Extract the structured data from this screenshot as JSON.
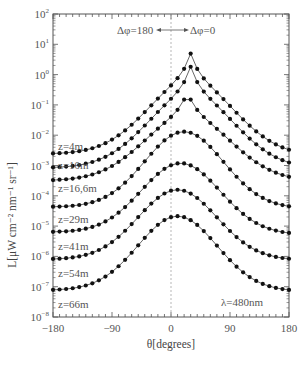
{
  "chart_data": {
    "type": "line",
    "title": "",
    "xlabel": "θ[degrees]",
    "ylabel": "L[μW cm⁻² nm⁻¹ sr⁻¹]",
    "xlim": [
      -180,
      180
    ],
    "ylim": [
      1e-08,
      100
    ],
    "yscale": "log",
    "grid": false,
    "x_ticks": [
      -180,
      -90,
      0,
      90,
      180
    ],
    "y_ticks": [
      "10²",
      "10¹",
      "10⁰",
      "10⁻¹",
      "10⁻²",
      "10⁻³",
      "10⁻⁴",
      "10⁻⁵",
      "10⁻⁶",
      "10⁻⁷",
      "10⁻⁸"
    ],
    "y_tick_exponents": [
      2,
      1,
      0,
      -1,
      -2,
      -3,
      -4,
      -5,
      -6,
      -7,
      -8
    ],
    "vertical_reference_line": 0,
    "annotations": {
      "direction_left": "Δφ=180",
      "direction_right": "Δφ=0",
      "wavelength": "λ=480nm"
    },
    "series_model_note": "Values are log10(L) read from the plot; x from -180 to 180 every 10 degrees",
    "series": [
      {
        "name": "z=4m",
        "left": -2.62,
        "right": -2.68,
        "peak": 0.7,
        "peak_x": 30,
        "sharp": true
      },
      {
        "name": "z=10m",
        "left": -3.08,
        "right": -3.1,
        "peak": 0.26,
        "peak_x": 30,
        "sharp": true
      },
      {
        "name": "z=16,6m",
        "left": -3.5,
        "right": -3.52,
        "peak": -0.57,
        "peak_x": 25,
        "sharp": true
      },
      {
        "name": "z=29m",
        "left": -4.37,
        "right": -4.42,
        "peak": -1.88,
        "peak_x": 20,
        "sharp": false
      },
      {
        "name": "z=41m",
        "left": -5.2,
        "right": -5.28,
        "peak": -2.92,
        "peak_x": 15,
        "sharp": false
      },
      {
        "name": "z=54m",
        "left": -6.1,
        "right": -6.12,
        "peak": -3.8,
        "peak_x": 10,
        "sharp": false
      },
      {
        "name": "z=66m",
        "left": -7.12,
        "right": -7.15,
        "peak": -4.67,
        "peak_x": 10,
        "sharp": false
      }
    ],
    "label_positions": [
      {
        "name": "z=4m",
        "y_exp": -2.35
      },
      {
        "name": "z=10m",
        "y_exp": -2.98
      },
      {
        "name": "z=16,6m",
        "y_exp": -3.75
      },
      {
        "name": "z=29m",
        "y_exp": -4.75
      },
      {
        "name": "z=41m",
        "y_exp": -5.65
      },
      {
        "name": "z=54m",
        "y_exp": -6.55
      },
      {
        "name": "z=66m",
        "y_exp": -7.58
      }
    ]
  },
  "colors": {
    "line": "#555555",
    "marker": "#111111",
    "axis": "#555555",
    "ref_line": "#999999"
  }
}
